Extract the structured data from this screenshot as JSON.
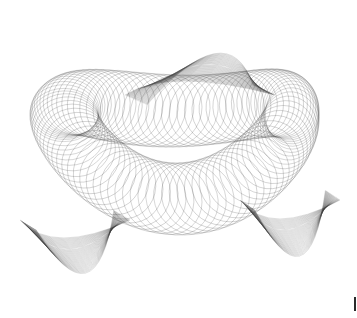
{
  "image": {
    "description": "Abstract line-art ribbon surface drawn with many thin gray curves on white background",
    "background": "#ffffff",
    "stroke_color": "#3a3a3a",
    "ribbon": {
      "center": [
        178,
        175
      ],
      "radius_x": 120,
      "radius_y": 80,
      "width": 38,
      "line_count": 90
    },
    "loops": [
      {
        "name": "upper-arch",
        "center": [
          200,
          95
        ],
        "rx": 75,
        "ry": 70
      },
      {
        "name": "left-fold",
        "center": [
          75,
          220
        ],
        "rx": 55,
        "ry": 90
      },
      {
        "name": "right-fold",
        "center": [
          290,
          200
        ],
        "rx": 50,
        "ry": 95
      }
    ]
  },
  "corner_mark": {
    "color": "#2a2a2a"
  }
}
